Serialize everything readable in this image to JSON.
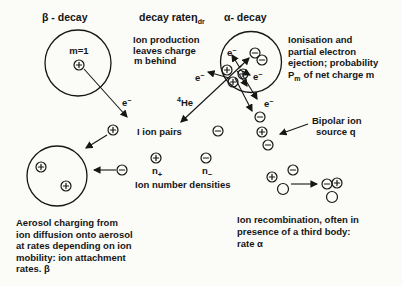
{
  "palette": {
    "background": "#fbfbf8",
    "ink": "#161616"
  },
  "headers": {
    "beta": "β - decay",
    "decay_rate": "decay rate",
    "eta": "η",
    "eta_sub": "dr",
    "alpha": "α- decay"
  },
  "beta": {
    "mass_label": "m=1"
  },
  "electron": {
    "base": "e",
    "sup": "−"
  },
  "helium": {
    "sup": "4",
    "base": "He"
  },
  "notes": {
    "ion_production": [
      "Ion production",
      "leaves charge",
      "m behind"
    ],
    "ionisation": [
      "Ionisation and",
      "partial electron",
      "ejection; probability"
    ],
    "ionisation_prob": {
      "base": "P",
      "sub": "m",
      "rest": "of net charge m"
    },
    "aerosol": [
      "Aerosol charging from",
      "ion diffusion onto aerosol",
      "at rates depending on ion",
      "mobility:  ion attachment",
      "rates.  β"
    ],
    "recombination": [
      "Ion recombination, often in",
      "presence of a third body:",
      "rate α"
    ]
  },
  "labels": {
    "ion_pairs": "I ion pairs",
    "n": "n",
    "plus": "+",
    "minus": "−",
    "ion_number_densities": "Ion number densities",
    "bipolar_line1": "Bipolar ion",
    "bipolar_line2": "source q"
  }
}
